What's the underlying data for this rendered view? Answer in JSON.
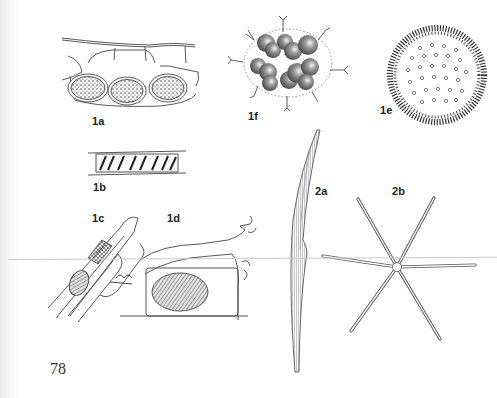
{
  "page": {
    "number": "78",
    "background": "#ffffff",
    "ink": "#333333"
  },
  "figures": [
    {
      "id": "1a",
      "label": "1a",
      "subject": "cells with three dotted oval bodies in plant tissue"
    },
    {
      "id": "1b",
      "label": "1b",
      "subject": "single filament cell with spiral banded chloroplast"
    },
    {
      "id": "1c",
      "label": "1c",
      "subject": "branched filament with dark oval spore and cross-hatched cell"
    },
    {
      "id": "1d",
      "label": "1d",
      "subject": "branching filament with large hatched oval body"
    },
    {
      "id": "1e",
      "label": "1e",
      "subject": "spherical colony with radiating spines and small circles"
    },
    {
      "id": "1f",
      "label": "1f",
      "subject": "colony of dark round cells with bristles inside dotted envelope"
    },
    {
      "id": "2a",
      "label": "2a",
      "subject": "long curved striated diatom"
    },
    {
      "id": "2b",
      "label": "2b",
      "subject": "six-armed star-shaped diatom colony"
    }
  ]
}
